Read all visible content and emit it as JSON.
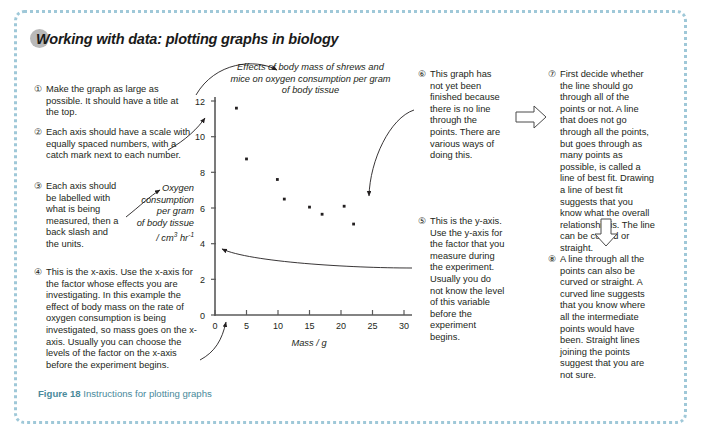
{
  "figure": {
    "title": "Working with data: plotting graphs in biology",
    "caption_label": "Figure 18",
    "caption_text": " Instructions for plotting graphs",
    "border_color": "#9fc8d8",
    "caption_color": "#4a8a9b"
  },
  "chart_title": "Effects of body mass of shrews and mice on oxygen consumption per gram of body tissue",
  "axis_labels": {
    "x": "Mass / g",
    "y_line1": "Oxygen",
    "y_line2": "consumption",
    "y_line3": "per gram",
    "y_line4": "of body tissue",
    "y_line5": "/ cm3 hr-1"
  },
  "notes": [
    {
      "num": "①",
      "text": "Make the graph as large as possible. It should have a title at the top."
    },
    {
      "num": "②",
      "text": "Each axis should have a scale with equally spaced numbers, with a catch mark next to each number."
    },
    {
      "num": "③",
      "text": "Each axis should be labelled with what is being measured, then a back slash and the units."
    },
    {
      "num": "④",
      "text": "This is the x-axis. Use the x-axis for the factor whose effects you are investigating. In this example the effect of body mass on the rate of oxygen consumption is being investigated, so mass goes on the x-axis. Usually you can choose the levels of the factor on the x-axis before the experiment begins."
    },
    {
      "num": "⑤",
      "text": "This is the y-axis. Use the y-axis for the factor that you measure during the experiment. Usually you do not know the level of this variable before the experiment begins."
    },
    {
      "num": "⑥",
      "text": "This graph has not yet been finished because there is no line through the points. There are various ways of doing this."
    },
    {
      "num": "⑦",
      "text": "First decide whether the line should go through all of the points or not. A line that does not go through all the points, but goes through as many points as possible, is called a line of best fit. Drawing a line of best fit suggests that you know what the overall relationship is. The line can be curved or straight."
    },
    {
      "num": "⑧",
      "text": "A line through all the points can also be curved or straight. A curved line suggests that you know where all the intermediate points would have been. Straight lines joining the points suggest that you are not sure."
    }
  ],
  "chart_data": {
    "type": "scatter",
    "title": "Effects of body mass of shrews and mice on oxygen consumption per gram of body tissue",
    "xlabel": "Mass / g",
    "ylabel": "Oxygen consumption per gram of body tissue / cm3 hr-1",
    "xlim": [
      0,
      31
    ],
    "ylim": [
      0,
      12.6
    ],
    "xticks": [
      0,
      5,
      10,
      15,
      20,
      25,
      30
    ],
    "yticks": [
      0,
      2,
      4,
      6,
      8,
      10,
      12
    ],
    "grid": false,
    "legend": false,
    "points": [
      {
        "x": 3.4,
        "y": 11.6
      },
      {
        "x": 5.0,
        "y": 8.75
      },
      {
        "x": 9.9,
        "y": 7.6
      },
      {
        "x": 11.0,
        "y": 6.5
      },
      {
        "x": 15.0,
        "y": 6.05
      },
      {
        "x": 17.0,
        "y": 5.65
      },
      {
        "x": 20.5,
        "y": 6.1
      },
      {
        "x": 22.0,
        "y": 5.1
      }
    ]
  }
}
